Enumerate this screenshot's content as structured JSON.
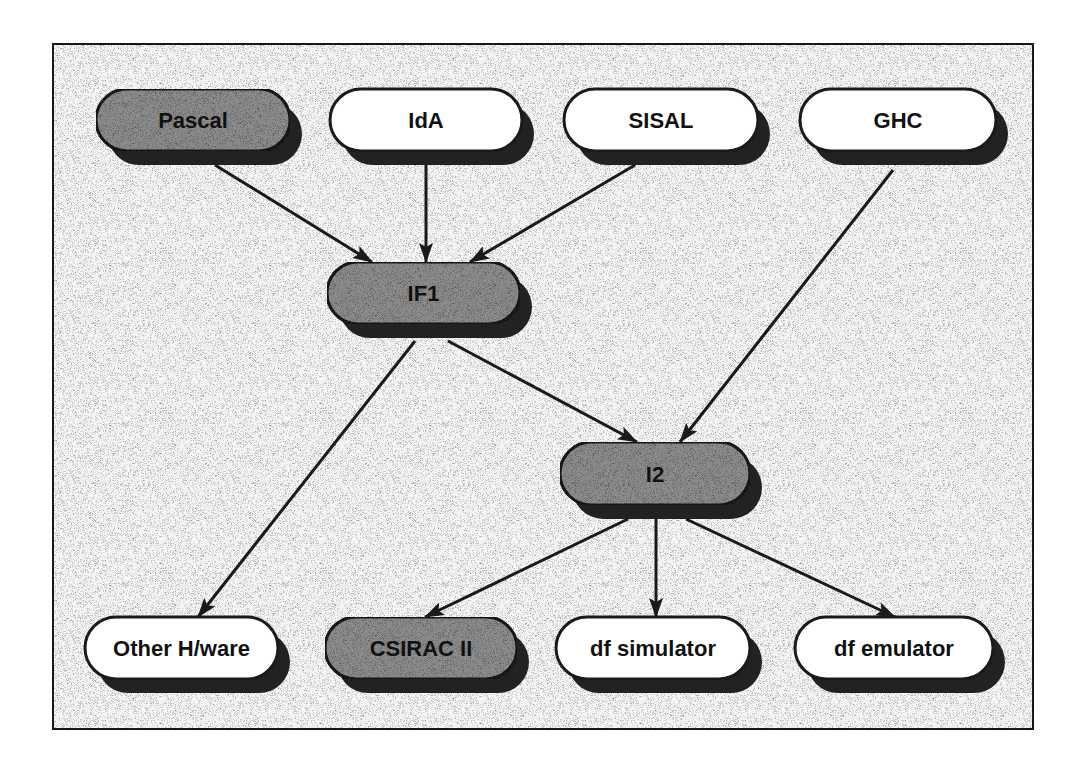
{
  "diagram": {
    "type": "flow-graph",
    "nodes": [
      {
        "id": "pascal",
        "label": "Pascal",
        "style": "shaded"
      },
      {
        "id": "ida",
        "label": "IdA",
        "style": "plain"
      },
      {
        "id": "sisal",
        "label": "SISAL",
        "style": "plain"
      },
      {
        "id": "ghc",
        "label": "GHC",
        "style": "plain"
      },
      {
        "id": "if1",
        "label": "IF1",
        "style": "shaded"
      },
      {
        "id": "i2",
        "label": "I2",
        "style": "shaded"
      },
      {
        "id": "other-hw",
        "label": "Other H/ware",
        "style": "plain"
      },
      {
        "id": "csirac",
        "label": "CSIRAC II",
        "style": "shaded"
      },
      {
        "id": "df-sim",
        "label": "df simulator",
        "style": "plain"
      },
      {
        "id": "df-emu",
        "label": "df emulator",
        "style": "plain"
      }
    ],
    "edges": [
      {
        "from": "pascal",
        "to": "if1"
      },
      {
        "from": "ida",
        "to": "if1"
      },
      {
        "from": "sisal",
        "to": "if1"
      },
      {
        "from": "ghc",
        "to": "i2"
      },
      {
        "from": "if1",
        "to": "i2"
      },
      {
        "from": "if1",
        "to": "other-hw"
      },
      {
        "from": "i2",
        "to": "csirac"
      },
      {
        "from": "i2",
        "to": "df-sim"
      },
      {
        "from": "i2",
        "to": "df-emu"
      }
    ]
  },
  "colors": {
    "shaded_fill": "#8c8c8c",
    "plain_fill": "#ffffff",
    "stroke": "#1a1a1a",
    "shadow": "#222222",
    "frame_fill": "#f7f7f7"
  }
}
